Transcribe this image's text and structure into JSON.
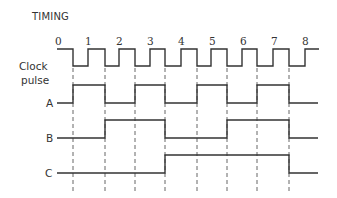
{
  "title": "TIMING",
  "clock_label_line1": "Clock",
  "clock_label_line2": "pulse",
  "signals": [
    {
      "name": "A",
      "levels": [
        0,
        1,
        1,
        0,
        0,
        1,
        1,
        0,
        0,
        1,
        1,
        0,
        0,
        1,
        1,
        0,
        0
      ]
    },
    {
      "name": "B",
      "levels": [
        0,
        0,
        0,
        1,
        1,
        1,
        1,
        0,
        0,
        0,
        0,
        1,
        1,
        1,
        1,
        0,
        0
      ]
    },
    {
      "name": "C",
      "levels": [
        0,
        0,
        0,
        0,
        0,
        0,
        0,
        1,
        1,
        1,
        1,
        1,
        1,
        1,
        1,
        0,
        0
      ]
    }
  ],
  "pulse_numbers": [
    "0",
    "1",
    "2",
    "3",
    "4",
    "5",
    "6",
    "7",
    "8"
  ],
  "colors": {
    "line": "#333333",
    "dash": "#666666"
  }
}
